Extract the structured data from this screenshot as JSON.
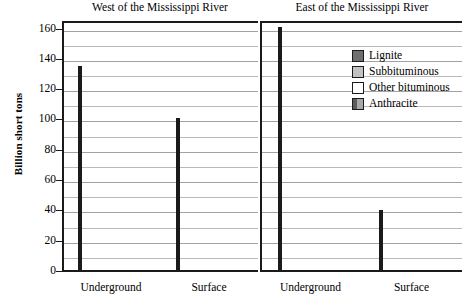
{
  "chart_data": {
    "type": "bar",
    "title": "",
    "ylabel": "Billion short tons",
    "xlabel": "",
    "ylim": [
      0,
      165
    ],
    "ytick_values": [
      0,
      20,
      40,
      60,
      80,
      100,
      120,
      140,
      160
    ],
    "ytick_labels": [
      "0",
      "20",
      "40",
      "60",
      "80",
      "100",
      "120",
      "140",
      "160"
    ],
    "minor_gridline_step": 10,
    "grid": true,
    "stacked": true,
    "legend_position": "upper-right-inside",
    "panels": [
      {
        "title": "West of the Mississippi River",
        "categories": [
          "Underground",
          "Surface"
        ],
        "bars": [
          {
            "category": "Underground",
            "total": 135,
            "segments": [
              {
                "name": "Other bituminous",
                "from": 0,
                "to": 26,
                "value": 26
              },
              {
                "name": "Subbituminous",
                "from": 26,
                "to": 135,
                "value": 109
              }
            ]
          },
          {
            "category": "Surface",
            "total": 101,
            "segments": [
              {
                "name": "Other bituminous",
                "from": 0,
                "to": 6,
                "value": 6
              },
              {
                "name": "Subbituminous",
                "from": 6,
                "to": 68,
                "value": 62
              },
              {
                "name": "Lignite",
                "from": 68,
                "to": 101,
                "value": 33
              }
            ]
          }
        ]
      },
      {
        "title": "East of the Mississippi River",
        "categories": [
          "Underground",
          "Surface"
        ],
        "bars": [
          {
            "category": "Underground",
            "total": 161,
            "segments": [
              {
                "name": "Anthracite",
                "from": 0,
                "to": 7,
                "value": 7
              },
              {
                "name": "Other bituminous",
                "from": 7,
                "to": 161,
                "value": 154
              }
            ]
          },
          {
            "category": "Surface",
            "total": 40.5,
            "segments": [
              {
                "name": "Anthracite",
                "from": 0,
                "to": 1.5,
                "value": 1.5
              },
              {
                "name": "Other bituminous",
                "from": 1.5,
                "to": 40.5,
                "value": 39
              }
            ]
          }
        ]
      }
    ],
    "legend": [
      {
        "label": "Lignite",
        "color": "#6f6f6f",
        "swatch": "solid-dark-gray"
      },
      {
        "label": "Subbituminous",
        "color": "#c2c2c2",
        "swatch": "solid-light-gray"
      },
      {
        "label": "Other bituminous",
        "color": "#ffffff",
        "swatch": "white"
      },
      {
        "label": "Anthracite",
        "color": "#5a5a5a",
        "swatch": "split-gray"
      }
    ]
  }
}
